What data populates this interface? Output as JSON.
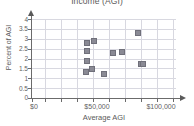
{
  "chart_data": {
    "type": "scatter",
    "title": "Income (AGI)",
    "xlabel": "Average AGI",
    "ylabel": "Percent of AGI",
    "xlim": [
      0,
      110000
    ],
    "ylim": [
      0,
      4.2
    ],
    "grid": true,
    "legend": "none",
    "xticks": [
      0,
      50000,
      100000
    ],
    "xticklabels": [
      "$0",
      "$50,000",
      "$100,000"
    ],
    "yticks": [
      0,
      0.5,
      1,
      1.5,
      2,
      2.5,
      3,
      3.5,
      4
    ],
    "yticklabels": [
      "0",
      "0.5",
      "1",
      "1.5",
      "2",
      "2.5",
      "3",
      "3.5",
      "4"
    ],
    "marker_color": "#8a8a94",
    "grid_color": "#d8d8e0",
    "axis_color": "#6b6b6b",
    "points": [
      {
        "x": 42000,
        "y": 2.95
      },
      {
        "x": 42000,
        "y": 2.5
      },
      {
        "x": 42000,
        "y": 1.95
      },
      {
        "x": 41000,
        "y": 1.38
      },
      {
        "x": 47000,
        "y": 3.02
      },
      {
        "x": 46000,
        "y": 1.52
      },
      {
        "x": 55000,
        "y": 1.27
      },
      {
        "x": 62000,
        "y": 2.4
      },
      {
        "x": 69000,
        "y": 2.45
      },
      {
        "x": 81000,
        "y": 3.43
      },
      {
        "x": 83000,
        "y": 1.8
      },
      {
        "x": 85000,
        "y": 1.8
      }
    ],
    "x": [
      42000,
      42000,
      42000,
      41000,
      47000,
      46000,
      55000,
      62000,
      69000,
      81000,
      83000,
      85000
    ],
    "y": [
      2.95,
      2.5,
      1.95,
      1.38,
      3.02,
      1.52,
      1.27,
      2.4,
      2.45,
      3.43,
      1.8,
      1.8
    ]
  }
}
